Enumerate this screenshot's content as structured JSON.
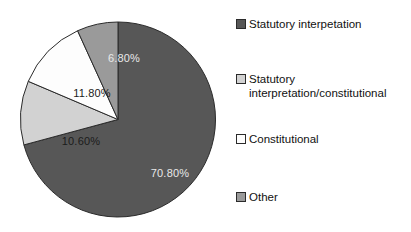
{
  "chart_data": {
    "type": "pie",
    "title": "",
    "subtitle": "",
    "xlabel": "",
    "ylabel": "",
    "start_angle_deg": 0,
    "direction": "clockwise",
    "grid": false,
    "legend_position": "right",
    "categories": [
      "Statutory interpetation",
      "Statutory interpretation/constitutional",
      "Constitutional",
      "Other"
    ],
    "values": [
      70.8,
      10.6,
      11.8,
      6.8
    ],
    "value_labels": [
      "70.80%",
      "10.60%",
      "11.80%",
      "6.80%"
    ],
    "colors": [
      "#575757",
      "#d2d2d2",
      "#fdfdfd",
      "#9a9a9a"
    ],
    "slice_label_colors": [
      "#e9e9e9",
      "#1b1b1b",
      "#1b1b1b",
      "#e9e9e9"
    ],
    "slices": [
      {
        "name": "Statutory interpetation",
        "value": 70.8,
        "label": "70.80%",
        "color": "#575757",
        "label_color": "on-dark",
        "label_x": 150,
        "label_y": 156
      },
      {
        "name": "Statutory interpretation/constitutional",
        "value": 10.6,
        "label": "10.60%",
        "color": "#d2d2d2",
        "label_color": "on-light",
        "label_x": 61,
        "label_y": 124
      },
      {
        "name": "Constitutional",
        "value": 11.8,
        "label": "11.80%",
        "color": "#fdfdfd",
        "label_color": "on-light",
        "label_y": 76,
        "label_x": 72
      },
      {
        "name": "Other",
        "value": 6.8,
        "label": "6.80%",
        "color": "#9a9a9a",
        "label_color": "on-dark",
        "label_x": 104,
        "label_y": 41
      }
    ]
  },
  "legend": {
    "entries": [
      {
        "label": "Statutory interpetation",
        "color": "#575757",
        "top": 7
      },
      {
        "label": "Statutory\ninterpretation/constitutional",
        "color": "#d2d2d2",
        "top": 62
      },
      {
        "label": "Constitutional",
        "color": "#fdfdfd",
        "top": 122
      },
      {
        "label": "Other",
        "color": "#9a9a9a",
        "top": 180
      }
    ]
  }
}
